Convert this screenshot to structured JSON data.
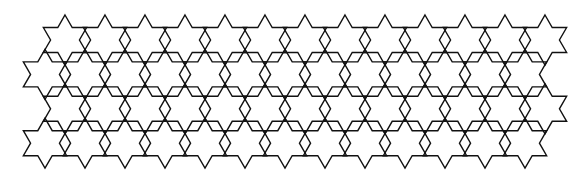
{
  "figure": {
    "background": "#ffffff",
    "stroke_color": "#111111",
    "stroke_width": 1.4
  },
  "pattern": {
    "shape": "hexagram",
    "outer_radius": 25,
    "inner_radius": 14.43,
    "rows": [
      {
        "cy": 40.0,
        "x_start": 65,
        "count": 13
      },
      {
        "cy": 74.4,
        "x_start": 45,
        "count": 13
      },
      {
        "cy": 108.8,
        "x_start": 65,
        "count": 13
      },
      {
        "cy": 143.2,
        "x_start": 45,
        "count": 13
      }
    ],
    "x_spacing": 40
  }
}
